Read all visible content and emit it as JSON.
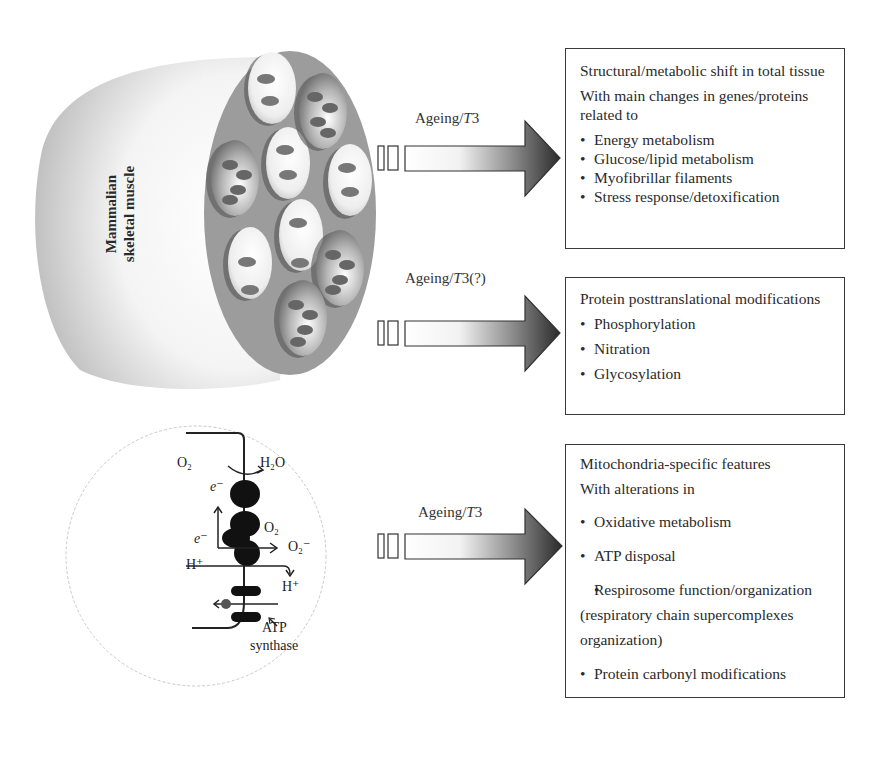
{
  "muscle": {
    "label_line1": "Mammalian",
    "label_line2": "skeletal muscle",
    "fiber_count": 10
  },
  "arrows": [
    {
      "label_prefix": "Ageing/",
      "label_italic": "T",
      "label_suffix": "3"
    },
    {
      "label_prefix": "Ageing/",
      "label_italic": "T",
      "label_suffix": "3(?)"
    },
    {
      "label_prefix": "Ageing/",
      "label_italic": "T",
      "label_suffix": "3"
    }
  ],
  "boxes": [
    {
      "heading": "Structural/metabolic shift in total tissue",
      "subheading": "With main changes in genes/proteins related to",
      "items": [
        "Energy metabolism",
        "Glucose/lipid metabolism",
        "Myofibrillar filaments",
        "Stress response/detoxification"
      ]
    },
    {
      "heading": "Protein posttranslational modifications",
      "items": [
        "Phosphorylation",
        "Nitration",
        "Glycosylation"
      ]
    },
    {
      "heading": "Mitochondria-specific features",
      "subheading": "With alterations in",
      "items": [
        "Oxidative metabolism",
        "ATP disposal",
        "Respirosome function/organization (respiratory chain supercomplexes organization)",
        "Protein carbonyl modifications"
      ]
    }
  ],
  "mitochondria": {
    "o2_top": "O₂",
    "h2o": "H₂O",
    "e_top": "e⁻",
    "e_mid": "e⁻",
    "o2_mid": "O₂",
    "superoxide": "O₂⁻",
    "h_left": "H⁺",
    "h_right": "H⁺",
    "atp_label_line1": "ATP",
    "atp_label_line2": "synthase"
  },
  "colors": {
    "arrow_dark": "#2b2b2b",
    "arrow_light": "#ffffff",
    "box_border": "#3a3a3a",
    "muscle_gray": "#bdbdbd",
    "fascicle_bg": "#9a9a9a"
  }
}
